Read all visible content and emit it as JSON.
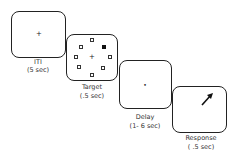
{
  "diagram": {
    "type": "trial-sequence",
    "stages": [
      {
        "name": "ITI",
        "duration": "(5 sec)",
        "content": "fixation"
      },
      {
        "name": "Target",
        "duration": "(.5 sec)",
        "content": "fixation + 8 peripheral squares, one filled (upper-right)"
      },
      {
        "name": "Delay",
        "duration": "(1- 6 sec)",
        "content": "fixation"
      },
      {
        "name": "Response",
        "duration": "( .5 sec)",
        "content": "arrow pointing upper-right"
      }
    ],
    "fixation_glyph": "+",
    "delay_glyph": "•",
    "colors": {
      "stroke": "#222222",
      "background": "#ffffff",
      "filled_target": "#111111"
    }
  }
}
